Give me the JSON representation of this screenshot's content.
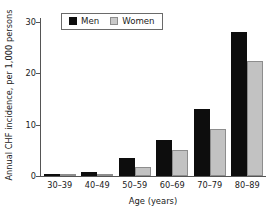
{
  "chart_data": {
    "type": "bar",
    "title": "",
    "xlabel": "Age (years)",
    "ylabel": "Annual CHF incidence, per 1,000 persons",
    "categories": [
      "30–39",
      "40–49",
      "50–59",
      "60–69",
      "70–79",
      "80–89"
    ],
    "series": [
      {
        "name": "Men",
        "color": "#0d0d0d",
        "values": [
          0.4,
          0.8,
          3.5,
          7.0,
          13.0,
          28.0
        ]
      },
      {
        "name": "Women",
        "color": "#c2c2c2",
        "values": [
          0.2,
          0.4,
          1.8,
          5.0,
          9.2,
          22.5
        ]
      }
    ],
    "ylim": [
      0,
      30
    ],
    "yticks": [
      0,
      10,
      20,
      30
    ],
    "ytick_labels": [
      "0",
      "10",
      "20",
      "30"
    ],
    "grid": false,
    "legend_position": "top-left-inside",
    "legend_entries": [
      "Men",
      "Women"
    ],
    "axis_color": "#555555",
    "background": "#ffffff"
  }
}
